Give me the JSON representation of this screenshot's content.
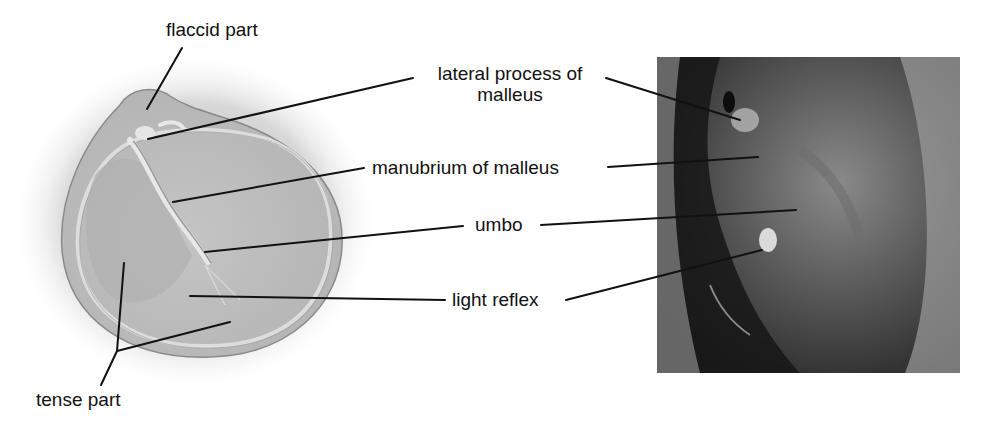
{
  "figure": {
    "labels": {
      "flaccid_part": "flaccid part",
      "lateral_process_line1": "lateral process of",
      "lateral_process_line2": "malleus",
      "manubrium": "manubrium of malleus",
      "umbo": "umbo",
      "light_reflex": "light reflex",
      "tense_part": "tense part"
    },
    "colors": {
      "background": "#ffffff",
      "text": "#111111",
      "leader": "#111111",
      "membrane": "#c8c8c8",
      "photo_dark": "#1a1a1a",
      "photo_light": "#9a9a9a"
    }
  }
}
